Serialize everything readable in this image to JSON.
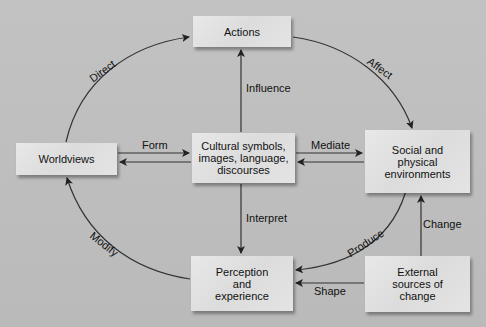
{
  "diagram": {
    "nodes": {
      "actions": "Actions",
      "worldviews": "Worldviews",
      "cultural": [
        "Cultural symbols,",
        "images, language,",
        "discourses"
      ],
      "social": [
        "Social and",
        "physical",
        "environments"
      ],
      "perception": [
        "Perception",
        "and",
        "experience"
      ],
      "external": [
        "External",
        "sources of",
        "change"
      ]
    },
    "edges": {
      "direct": "Direct",
      "affect": "Affect",
      "influence": "Influence",
      "form": "Form",
      "mediate": "Mediate",
      "interpret": "Interpret",
      "modify": "Modify",
      "produce": "Produce",
      "change": "Change",
      "shape": "Shape"
    },
    "colors": {
      "background": "#bdbdbd",
      "box": "#e2e2e2",
      "line": "#333333"
    }
  }
}
